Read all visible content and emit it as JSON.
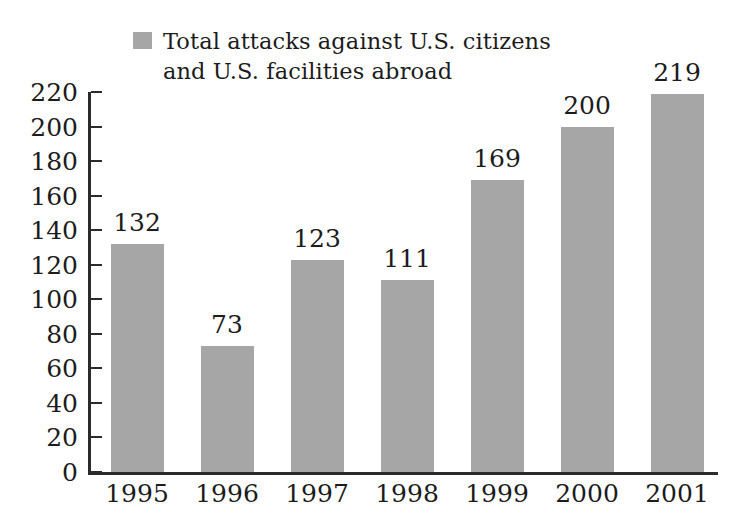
{
  "chart_data": {
    "type": "bar",
    "title": "",
    "subtitle": "",
    "xlabel": "",
    "ylabel": "",
    "categories": [
      "1995",
      "1996",
      "1997",
      "1998",
      "1999",
      "2000",
      "2001"
    ],
    "values": [
      132,
      73,
      123,
      111,
      169,
      200,
      219
    ],
    "data_labels": [
      "132",
      "73",
      "123",
      "111",
      "169",
      "200",
      "219"
    ],
    "series": [
      {
        "name": "Total attacks against U.S. citizens and U.S. facilities abroad",
        "values": [
          132,
          73,
          123,
          111,
          169,
          200,
          219
        ],
        "color": "#a6a6a6"
      }
    ],
    "ylim": [
      0,
      220
    ],
    "ytick_step": 20,
    "ytick_labels": [
      "220",
      "200",
      "180",
      "160",
      "140",
      "120",
      "100",
      "80",
      "60",
      "40",
      "20",
      "0"
    ],
    "ytick_values": [
      220,
      200,
      180,
      160,
      140,
      120,
      100,
      80,
      60,
      40,
      20,
      0
    ],
    "grid": false,
    "legend_position": "top-left",
    "legend": [
      {
        "label": "Total attacks against U.S. citizens\nand U.S. facilities abroad",
        "color": "#a6a6a6"
      }
    ],
    "axis_color": "#2b2b2b",
    "background_color": "#ffffff"
  }
}
